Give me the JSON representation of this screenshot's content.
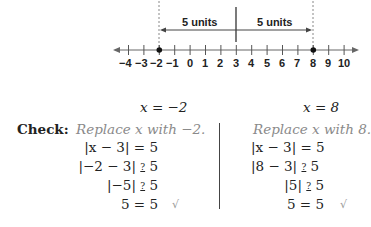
{
  "number_line": {
    "labels": [
      "−4",
      "−3",
      "−2",
      "−1",
      "0",
      "1",
      "2",
      "3",
      "4",
      "5",
      "6",
      "7",
      "8",
      "9",
      "10"
    ],
    "points": [
      "−2",
      "8"
    ],
    "center": "3",
    "left_span_label": "5 units",
    "right_span_label": "5 units"
  },
  "left": {
    "header": "x = −2",
    "replace": "Replace x with −2.",
    "lines": [
      "|x − 3| = 5",
      "|−2 − 3|",
      "|−5|",
      "5 = 5"
    ],
    "q5": "5",
    "check_mark": "√"
  },
  "right": {
    "header": "x = 8",
    "replace": "Replace x with 8.",
    "lines": [
      "|x − 3| = 5",
      "|8 − 3|",
      "|5|",
      "5 = 5"
    ],
    "q5": "5",
    "check_mark": "√"
  },
  "check_label": "Check:",
  "q_symbol": "?"
}
